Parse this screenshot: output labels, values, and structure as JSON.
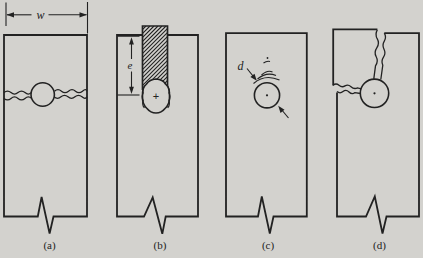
{
  "figure": {
    "colors": {
      "background": "#d3d2ce",
      "ink": "#222222"
    },
    "panel_labels": [
      "(a)",
      "(b)",
      "(c)",
      "(d)"
    ],
    "labels": {
      "plate_width": "w",
      "slot_depth": "e",
      "hole_diameter": "d",
      "hole_center_mark": "+"
    }
  }
}
